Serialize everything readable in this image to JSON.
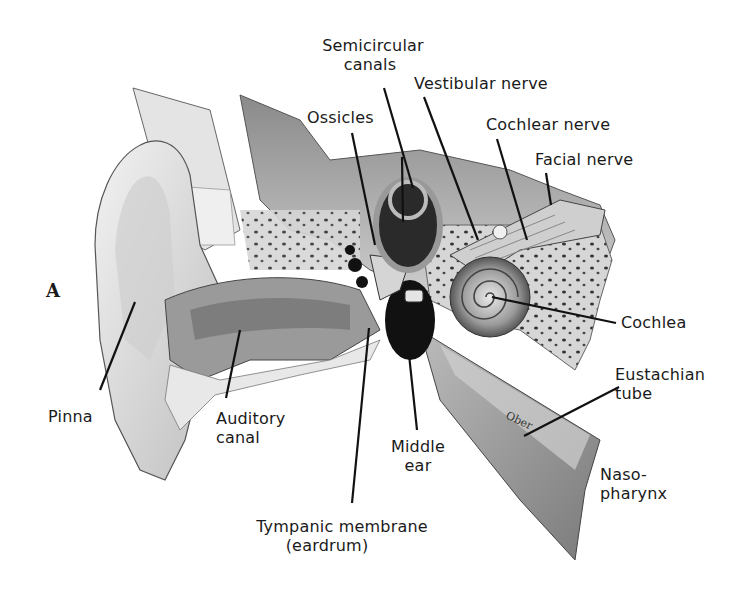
{
  "figure": {
    "panel_letter": "A",
    "signature": "Ober"
  },
  "labels": {
    "semicircular_canals": [
      "Semicircular",
      "canals"
    ],
    "vestibular_nerve": "Vestibular nerve",
    "ossicles": "Ossicles",
    "cochlear_nerve": "Cochlear nerve",
    "facial_nerve": "Facial nerve",
    "cochlea": "Cochlea",
    "eustachian_tube": [
      "Eustachian",
      "tube"
    ],
    "pinna": "Pinna",
    "auditory_canal": [
      "Auditory",
      "canal"
    ],
    "middle_ear": [
      "Middle",
      "ear"
    ],
    "nasopharynx": [
      "Naso-",
      "pharynx"
    ],
    "tympanic_membrane": [
      "Tympanic membrane",
      "(eardrum)"
    ]
  },
  "colors": {
    "ink": "#1a1a1a",
    "bone_light": "#d8d8d8",
    "bone_mid": "#a8a8a8",
    "dark": "#2a2a2a",
    "background": "#ffffff"
  }
}
